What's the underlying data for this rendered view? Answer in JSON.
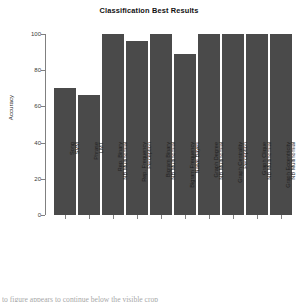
{
  "chart_data": {
    "type": "bar",
    "title": "Classification Best Results",
    "xlabel": "",
    "ylabel": "Accuracy",
    "ylim": [
      0,
      100
    ],
    "yticks": [
      "0",
      "20",
      "40",
      "60",
      "80",
      "100"
    ],
    "grid": false,
    "legend": null,
    "bar_color": "#4a4a4a",
    "categories": [
      "Song SVM",
      "Phrase LMT",
      "Rep. Binary NB Multinomial",
      "Rep. Frequency Perception",
      "Bigram Binary NB Multinomial",
      "Bigram Frequency Naive Bayes",
      "Graph Degree NB Multinomial",
      "Graph Centrality Perception",
      "Graph Clique NB Multinomial",
      "Graph Eccentricity NB Multinomial"
    ],
    "category_lines": [
      {
        "line1": "Song",
        "line2": "SVM"
      },
      {
        "line1": "Phrase",
        "line2": "LMT"
      },
      {
        "line1": "Rep. Binary",
        "line2": "NB Multinomial"
      },
      {
        "line1": "Rep. Frequency",
        "line2": "Perception"
      },
      {
        "line1": "Bigram Binary",
        "line2": "NB Multinomial"
      },
      {
        "line1": "Bigram Frequency",
        "line2": "Naive Bayes"
      },
      {
        "line1": "Graph Degree",
        "line2": "NB Multinomial"
      },
      {
        "line1": "Graph Centrality",
        "line2": "Perception"
      },
      {
        "line1": "Graph Clique",
        "line2": "NB Multinomial"
      },
      {
        "line1": "Graph Eccentricity",
        "line2": "NB Multinomial"
      }
    ],
    "values": [
      70,
      66.5,
      100,
      96,
      100,
      89,
      100,
      100,
      100,
      100
    ]
  },
  "caption": {
    "text": "to figure appears to continue below the visible crop"
  }
}
